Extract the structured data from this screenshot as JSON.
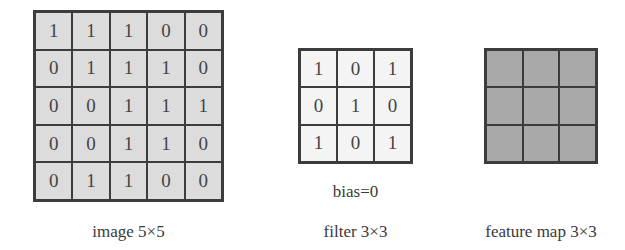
{
  "image": {
    "label": "image 5×5",
    "rows": 5,
    "cols": 5,
    "values": [
      [
        "1",
        "1",
        "1",
        "0",
        "0"
      ],
      [
        "0",
        "1",
        "1",
        "1",
        "0"
      ],
      [
        "0",
        "0",
        "1",
        "1",
        "1"
      ],
      [
        "0",
        "0",
        "1",
        "1",
        "0"
      ],
      [
        "0",
        "1",
        "1",
        "0",
        "0"
      ]
    ],
    "fill_color": "#dcdcdc"
  },
  "filter": {
    "label": "filter 3×3",
    "bias_label": "bias=0",
    "rows": 3,
    "cols": 3,
    "values": [
      [
        "1",
        "0",
        "1"
      ],
      [
        "0",
        "1",
        "0"
      ],
      [
        "1",
        "0",
        "1"
      ]
    ],
    "fill_color": "#f4f4f4"
  },
  "feature_map": {
    "label": "feature map 3×3",
    "rows": 3,
    "cols": 3,
    "values": [
      [
        "",
        "",
        ""
      ],
      [
        "",
        "",
        ""
      ],
      [
        "",
        "",
        ""
      ]
    ],
    "fill_color": "#a9a9a9"
  }
}
